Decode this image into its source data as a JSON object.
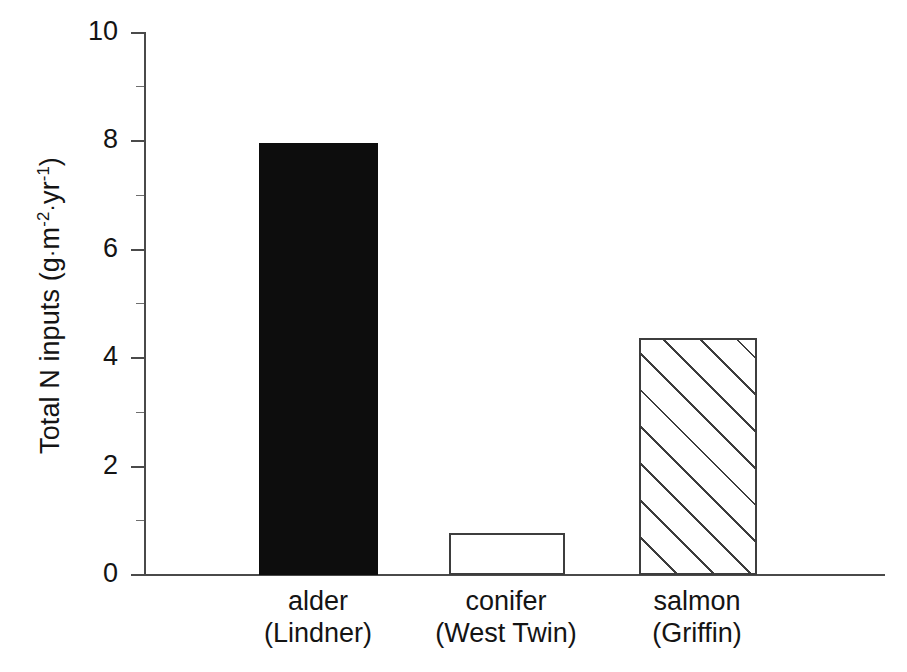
{
  "chart_data": {
    "type": "bar",
    "title": "",
    "xlabel": "",
    "ylabel": "Total N inputs (g·m-2·yr-1)",
    "ylabel_parts": {
      "lead": "Total N inputs (g",
      "dot1": "·",
      "m": "m",
      "m_exp": "-2",
      "dot2": "·",
      "yr": "yr",
      "yr_exp": "-1",
      "tail": ")"
    },
    "categories": [
      "alder (Lindner)",
      "conifer (West Twin)",
      "salmon (Griffin)"
    ],
    "category_lines": [
      [
        "alder",
        "(Lindner)"
      ],
      [
        "conifer",
        "(West Twin)"
      ],
      [
        "salmon",
        "(Griffin)"
      ]
    ],
    "values": [
      7.95,
      0.77,
      4.37
    ],
    "ylim": [
      0,
      10
    ],
    "xlim_note": "categorical",
    "ytick_labels": [
      "0",
      "2",
      "4",
      "6",
      "8",
      "10"
    ],
    "ytick_values": [
      0,
      2,
      4,
      6,
      8,
      10
    ],
    "yminor_values": [
      1,
      3,
      5,
      7,
      9
    ],
    "grid": false,
    "legend": "none",
    "bar_styles": [
      "solid-black",
      "open-white",
      "diagonal-hatch"
    ],
    "colors": {
      "bar_solid": "#0d0d0d",
      "bar_open_fill": "#ffffff",
      "bar_outline": "#3d3d3d",
      "hatch_line": "#3d3d3d",
      "axis": "#4a4a4a",
      "text": "#141414",
      "background": "#ffffff"
    }
  }
}
